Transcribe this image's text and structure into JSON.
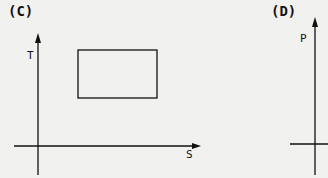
{
  "panels": [
    {
      "label": "(C)",
      "y_axis": "T",
      "x_axis": "S",
      "shape": "rectangle"
    },
    {
      "label": "(D)",
      "y_axis": "P"
    }
  ],
  "colors": {
    "background": "#f1f1ef",
    "ink": "#111111"
  }
}
